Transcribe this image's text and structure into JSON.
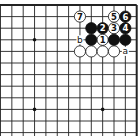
{
  "diagram": {
    "type": "go-board-problem",
    "board": {
      "right_edge_x": 136.7,
      "top_edge_y": 5,
      "col_spacing": 11.35,
      "row_spacing": 11.6,
      "visible_cols": 12,
      "visible_rows": 12,
      "line_color": "#222222",
      "edge_width": 2,
      "line_width": 0.9
    },
    "hoshi": [
      {
        "c": 9,
        "r": 3
      },
      {
        "c": 3,
        "r": 9
      },
      {
        "c": 9,
        "r": 9
      }
    ],
    "stones": [
      {
        "c": 5,
        "r": 1,
        "color": "white",
        "label": "7"
      },
      {
        "c": 2,
        "r": 1,
        "color": "white",
        "label": "5"
      },
      {
        "c": 1,
        "r": 1,
        "color": "black",
        "label": "6"
      },
      {
        "c": 4,
        "r": 2,
        "color": "black",
        "label": ""
      },
      {
        "c": 3,
        "r": 2,
        "color": "black",
        "label": "2"
      },
      {
        "c": 2,
        "r": 2,
        "color": "white",
        "label": "3"
      },
      {
        "c": 1,
        "r": 2,
        "color": "black",
        "label": "4"
      },
      {
        "c": 4,
        "r": 3,
        "color": "black",
        "label": ""
      },
      {
        "c": 3,
        "r": 3,
        "color": "white",
        "label": "1"
      },
      {
        "c": 2,
        "r": 3,
        "color": "black",
        "label": ""
      },
      {
        "c": 1,
        "r": 3,
        "color": "black",
        "label": ""
      },
      {
        "c": 5,
        "r": 4,
        "color": "white",
        "label": ""
      },
      {
        "c": 4,
        "r": 4,
        "color": "white",
        "label": ""
      },
      {
        "c": 3,
        "r": 4,
        "color": "white",
        "label": ""
      },
      {
        "c": 2,
        "r": 4,
        "color": "white",
        "label": ""
      }
    ],
    "markers": [
      {
        "c": 5,
        "r": 3,
        "text": "b"
      },
      {
        "c": 1,
        "r": 4,
        "text": "a"
      }
    ]
  }
}
